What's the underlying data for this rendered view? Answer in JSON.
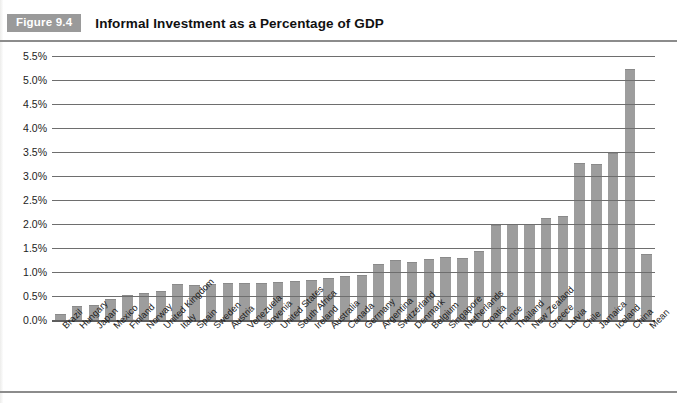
{
  "figure": {
    "badge": "Figure 9.4",
    "title": "Informal Investment as a Percentage of GDP"
  },
  "chart_data": {
    "type": "bar",
    "title": "Informal Investment as a Percentage of GDP",
    "xlabel": "",
    "ylabel": "",
    "ylim": [
      0,
      5.5
    ],
    "ytick_labels": [
      "5.5%",
      "5.0%",
      "4.5%",
      "4.0%",
      "3.5%",
      "3.0%",
      "2.5%",
      "2.0%",
      "1.5%",
      "1.0%",
      "0.5%",
      "0.0%"
    ],
    "ytick_values": [
      5.5,
      5.0,
      4.5,
      4.0,
      3.5,
      3.0,
      2.5,
      2.0,
      1.5,
      1.0,
      0.5,
      0.0
    ],
    "grid": true,
    "legend": "none",
    "bar_color": "#9d9d9d",
    "categories": [
      "Brazil",
      "Hungary",
      "Japan",
      "Mexico",
      "Finland",
      "Norway",
      "United Kingdom",
      "Italy",
      "Spain",
      "Sweden",
      "Austria",
      "Venezuela",
      "Slovenia",
      "United States",
      "South Africa",
      "Ireland",
      "Australia",
      "Canada",
      "Germany",
      "Argentina",
      "Switzerland",
      "Denmark",
      "Belgium",
      "Singapore",
      "Netherlands",
      "Croatia",
      "France",
      "Thailand",
      "New Zealand",
      "Greece",
      "Latvia",
      "Chile",
      "Jamaica",
      "Iceland",
      "China",
      "Mean"
    ],
    "values": [
      0.1,
      0.28,
      0.3,
      0.42,
      0.5,
      0.55,
      0.58,
      0.72,
      0.7,
      0.72,
      0.74,
      0.76,
      0.75,
      0.78,
      0.8,
      0.82,
      0.85,
      0.9,
      0.92,
      1.15,
      1.22,
      1.18,
      1.25,
      1.3,
      1.28,
      1.42,
      1.95,
      1.98,
      1.98,
      2.1,
      2.15,
      3.25,
      3.22,
      3.45,
      5.2,
      1.35
    ]
  }
}
